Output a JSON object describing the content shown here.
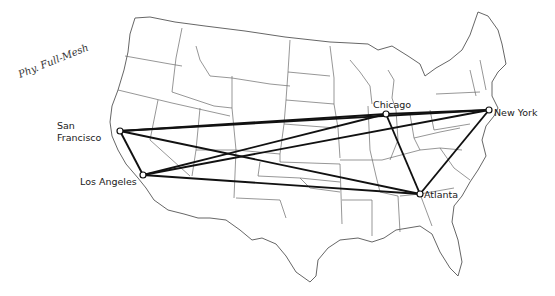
{
  "diagram": {
    "title_note": "Phy. Full-Mesh",
    "topology": "full-mesh",
    "background_map": "United States (contiguous) state outlines",
    "colors": {
      "link": "#111111",
      "node_fill": "#ffffff",
      "state_lines": "#6a6a6a"
    },
    "nodes": [
      {
        "id": "sf",
        "label_line1": "San",
        "label_line2": "Francisco",
        "x": 120,
        "y": 131
      },
      {
        "id": "la",
        "label": "Los Angeles",
        "x": 143,
        "y": 175
      },
      {
        "id": "chi",
        "label": "Chicago",
        "x": 386,
        "y": 114
      },
      {
        "id": "ny",
        "label": "New York",
        "x": 489,
        "y": 110
      },
      {
        "id": "atl",
        "label": "Atlanta",
        "x": 420,
        "y": 194
      }
    ],
    "links": [
      {
        "from": "sf",
        "to": "la"
      },
      {
        "from": "sf",
        "to": "chi"
      },
      {
        "from": "sf",
        "to": "ny"
      },
      {
        "from": "sf",
        "to": "atl"
      },
      {
        "from": "la",
        "to": "chi"
      },
      {
        "from": "la",
        "to": "ny"
      },
      {
        "from": "la",
        "to": "atl"
      },
      {
        "from": "chi",
        "to": "ny"
      },
      {
        "from": "chi",
        "to": "atl"
      },
      {
        "from": "ny",
        "to": "atl"
      }
    ]
  }
}
